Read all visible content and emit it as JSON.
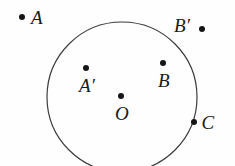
{
  "figure": {
    "width": 235,
    "height": 166,
    "background_color": "#fefefe",
    "stroke_color": "#3c3c3c",
    "point_color": "#151515",
    "label_color": "#1a1a1a"
  },
  "circle": {
    "name": "main-circle",
    "center_x": 122,
    "center_y": 97,
    "radius": 75,
    "stroke_width": 1.2,
    "fill": "none",
    "note": "bottom arc cropped by image edge"
  },
  "points": [
    {
      "id": "A",
      "label": "A",
      "x": 22,
      "y": 17,
      "label_x": 37,
      "label_y": 17,
      "label_position": "right",
      "inside_circle": false
    },
    {
      "id": "B-prime",
      "label": "B′",
      "x": 202,
      "y": 29,
      "label_x": 182,
      "label_y": 25,
      "label_position": "left",
      "inside_circle": false
    },
    {
      "id": "A-prime",
      "label": "A′",
      "x": 86,
      "y": 68,
      "label_x": 87,
      "label_y": 85,
      "label_position": "below",
      "inside_circle": true
    },
    {
      "id": "B",
      "label": "B",
      "x": 163,
      "y": 63,
      "label_x": 164,
      "label_y": 80,
      "label_position": "below",
      "inside_circle": true
    },
    {
      "id": "O",
      "label": "O",
      "x": 121,
      "y": 96,
      "label_x": 122,
      "label_y": 113,
      "label_position": "below",
      "inside_circle": true
    },
    {
      "id": "C",
      "label": "C",
      "x": 194,
      "y": 122,
      "label_x": 208,
      "label_y": 122,
      "label_position": "right",
      "inside_circle": false,
      "on_circle": true
    }
  ]
}
